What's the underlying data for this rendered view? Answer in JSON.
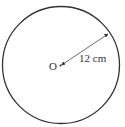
{
  "diagram": {
    "shape": "circle",
    "center_label": "O",
    "radius_label": "12 cm",
    "colors": {
      "stroke": "#333333",
      "background": "#ffffff"
    }
  }
}
